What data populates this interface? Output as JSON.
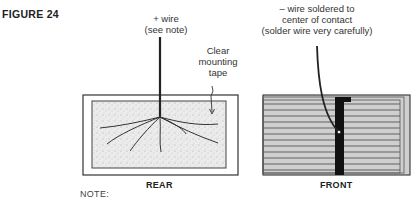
{
  "figure": {
    "title": "FIGURE 24"
  },
  "rear": {
    "caption": "REAR",
    "wire_label_line1": "+ wire",
    "wire_label_line2": "(see note)",
    "tape_label_line1": "Clear",
    "tape_label_line2": "mounting",
    "tape_label_line3": "tape"
  },
  "front": {
    "caption": "FRONT",
    "wire_label_line1": "– wire soldered to",
    "wire_label_line2": "center of contact",
    "wire_label_line3": "(solder wire very carefully)"
  },
  "note": {
    "label": "NOTE:"
  },
  "colors": {
    "line": "#333333",
    "tape_fill": "#e4e4e4",
    "front_fill": "#c8c8c8",
    "contact_bar": "#111111"
  }
}
